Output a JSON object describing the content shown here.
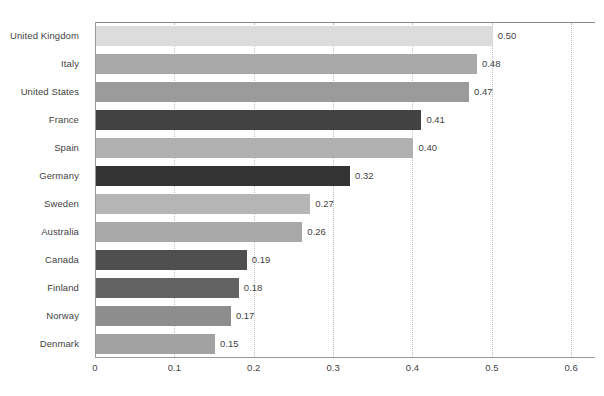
{
  "chart_data": {
    "type": "bar",
    "orientation": "horizontal",
    "title": "",
    "subtitle": "",
    "xlabel": "",
    "ylabel": "",
    "xlim": [
      0,
      0.63
    ],
    "xticks": [
      0,
      0.1,
      0.2,
      0.3,
      0.4,
      0.5,
      0.6
    ],
    "xtick_labels": [
      "0",
      "0.1",
      "0.2",
      "0.3",
      "0.4",
      "0.5",
      "0.6"
    ],
    "grid": "vertical-dotted",
    "legend": "none",
    "categories": [
      "United Kingdom",
      "Italy",
      "United States",
      "France",
      "Spain",
      "Germany",
      "Sweden",
      "Australia",
      "Canada",
      "Finland",
      "Norway",
      "Denmark"
    ],
    "values": [
      0.5,
      0.48,
      0.47,
      0.41,
      0.4,
      0.32,
      0.27,
      0.26,
      0.19,
      0.18,
      0.17,
      0.15
    ],
    "value_labels": [
      "0.50",
      "0.48",
      "0.47",
      "0.41",
      "0.40",
      "0.32",
      "0.27",
      "0.26",
      "0.19",
      "0.18",
      "0.17",
      "0.15"
    ],
    "bar_colors": [
      "#dcdcdc",
      "#a8a8a8",
      "#9b9b9b",
      "#434343",
      "#b0b0b0",
      "#333333",
      "#b5b5b5",
      "#a9a9a9",
      "#4f4f4f",
      "#626262",
      "#8d8d8d",
      "#a2a2a2"
    ],
    "axis_color": "#9a9a9a",
    "gridline_color": "#bdbdbd",
    "text_color": "#3f3f3f",
    "background": "#ffffff"
  }
}
